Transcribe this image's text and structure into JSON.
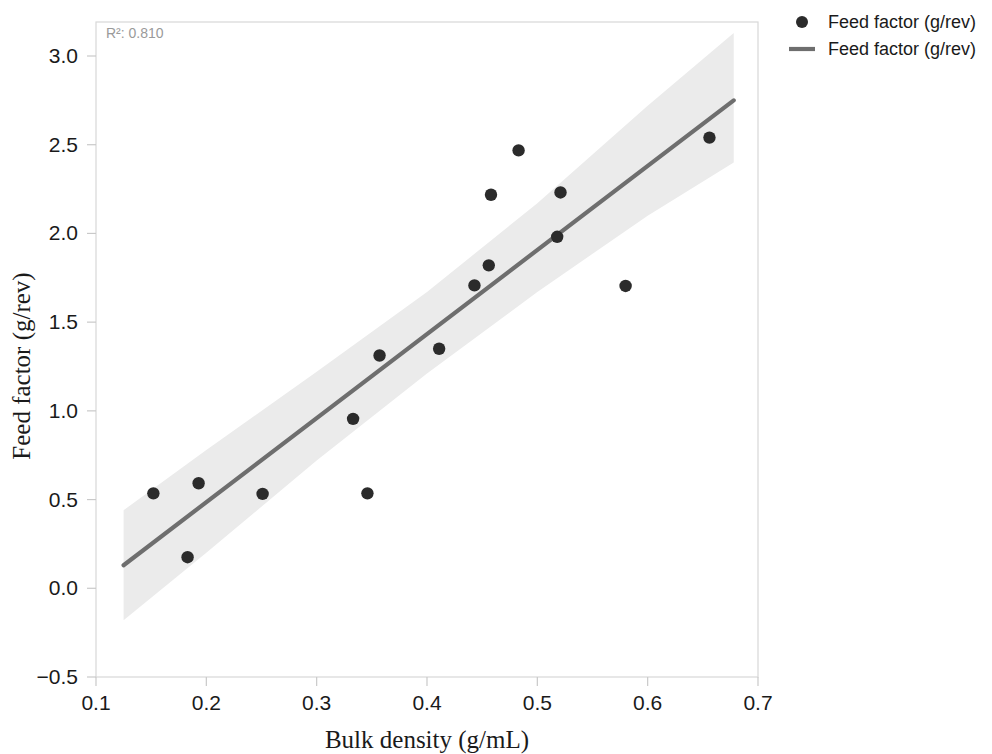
{
  "chart_data": {
    "type": "scatter",
    "title": "",
    "xlabel": "Bulk density (g/mL)",
    "ylabel": "Feed factor (g/rev)",
    "xlim": [
      0.1,
      0.7
    ],
    "ylim": [
      -0.5,
      3.25
    ],
    "xticks": [
      0.1,
      0.2,
      0.3,
      0.4,
      0.5,
      0.6,
      0.7
    ],
    "xtick_labels": [
      "0.1",
      "0.2",
      "0.3",
      "0.4",
      "0.5",
      "0.6",
      "0.7"
    ],
    "yticks": [
      -0.5,
      0.0,
      0.5,
      1.0,
      1.5,
      2.0,
      2.5,
      3.0
    ],
    "ytick_labels": [
      "−0.5",
      "0.0",
      "0.5",
      "1.0",
      "1.5",
      "2.0",
      "2.5",
      "3.0"
    ],
    "grid": false,
    "annotation": "R²: 0.810",
    "r_squared": 0.81,
    "marker_color": "#2b2b2b",
    "line_color": "#6e6e6e",
    "band_color": "#ebebeb",
    "series": [
      {
        "name": "Feed factor (g/rev)",
        "type": "scatter",
        "points": [
          {
            "x": 0.152,
            "y": 0.535
          },
          {
            "x": 0.183,
            "y": 0.175
          },
          {
            "x": 0.193,
            "y": 0.592
          },
          {
            "x": 0.251,
            "y": 0.532
          },
          {
            "x": 0.333,
            "y": 0.955
          },
          {
            "x": 0.346,
            "y": 0.535
          },
          {
            "x": 0.357,
            "y": 1.312
          },
          {
            "x": 0.411,
            "y": 1.35
          },
          {
            "x": 0.443,
            "y": 1.707
          },
          {
            "x": 0.456,
            "y": 1.82
          },
          {
            "x": 0.458,
            "y": 2.218
          },
          {
            "x": 0.483,
            "y": 2.468
          },
          {
            "x": 0.518,
            "y": 1.981
          },
          {
            "x": 0.521,
            "y": 2.231
          },
          {
            "x": 0.58,
            "y": 1.704
          },
          {
            "x": 0.656,
            "y": 2.54
          }
        ]
      },
      {
        "name": "Feed factor (g/rev)",
        "type": "line",
        "fit": {
          "slope": 4.77,
          "intercept": -0.49
        },
        "x_start": 0.125,
        "y_start": 0.13,
        "x_end": 0.678,
        "y_end": 2.75,
        "confidence_band": {
          "x": [
            0.125,
            0.2,
            0.3,
            0.4,
            0.5,
            0.6,
            0.678
          ],
          "lower": [
            -0.18,
            0.2,
            0.72,
            1.21,
            1.67,
            2.1,
            2.4
          ],
          "upper": [
            0.44,
            0.78,
            1.22,
            1.67,
            2.17,
            2.72,
            3.13
          ]
        }
      }
    ]
  },
  "legend": {
    "position": "upper-right-outside",
    "entries": [
      {
        "label": "Feed factor (g/rev)",
        "marker": "dot"
      },
      {
        "label": "Feed factor (g/rev)",
        "marker": "line"
      }
    ]
  }
}
